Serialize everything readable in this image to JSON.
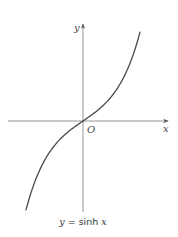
{
  "chart_data": {
    "type": "line",
    "title": "",
    "caption": "y = sinh x",
    "caption_parts": {
      "lhs": "y",
      "eq": " = sinh ",
      "rhs": "x"
    },
    "xlabel": "x",
    "ylabel": "y",
    "origin_label": "O",
    "grid": false,
    "legend": null,
    "xlim": [
      -2.4,
      2.4
    ],
    "ylim": [
      -5.5,
      5.6
    ],
    "series": [
      {
        "name": "sinh x",
        "function": "sinh",
        "x": [
          -2.4,
          -2.0,
          -1.5,
          -1.0,
          -0.5,
          0,
          0.5,
          1.0,
          1.5,
          2.0,
          2.4
        ],
        "y": [
          -5.47,
          -3.63,
          -2.13,
          -1.18,
          -0.52,
          0,
          0.52,
          1.18,
          2.13,
          3.63,
          5.47
        ]
      }
    ],
    "colors": {
      "curve": "#4a4a4a",
      "axes": "#777777",
      "text": "#444444"
    }
  }
}
